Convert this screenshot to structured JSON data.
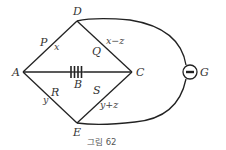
{
  "figure": {
    "caption": "그림 62",
    "nodes": {
      "A": "A",
      "B": "B",
      "C": "C",
      "D": "D",
      "E": "E",
      "G": "G"
    },
    "resistors": {
      "P": "P",
      "Q": "Q",
      "R": "R",
      "S": "S"
    },
    "currents": {
      "AD": "x",
      "DC": "x−z",
      "AE": "y",
      "EC": "y+z"
    },
    "galvanometer_symbol": "minus-in-circle",
    "battery_cells": 4,
    "colors": {
      "line": "#222222",
      "text": "#333333",
      "background": "#ffffff"
    }
  }
}
